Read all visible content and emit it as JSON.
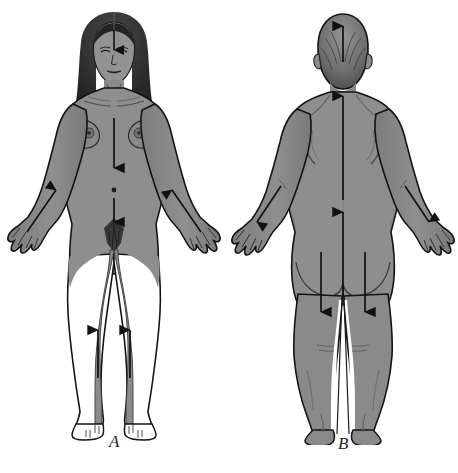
{
  "figure": {
    "title": "Anterior and posterior body views with directional flow arrows",
    "background_color": "#ffffff",
    "skin_fill": "#8c8c8c",
    "skin_fill_light": "#9a9a9a",
    "shadow_fill": "#6f6f6f",
    "hair_fill": "#2e2e2e",
    "outline_color": "#131313",
    "arrow_color": "#111111",
    "white_fill": "#ffffff"
  },
  "panels": [
    {
      "id": "anterior",
      "label": "A",
      "view": "anterior",
      "description": "Female figure, front view, arms abducted, showing downward arrows on forehead, chest and abdomen, upward arrows along forearms and lower legs",
      "arrows": [
        {
          "name": "forehead-arrow-down",
          "direction": "down",
          "region": "forehead"
        },
        {
          "name": "chest-arrow-down",
          "direction": "down",
          "region": "sternum-to-epigastrium"
        },
        {
          "name": "abdomen-arrow-down",
          "direction": "down",
          "region": "umbilicus-to-pubis"
        },
        {
          "name": "left-forearm-arrow-up",
          "direction": "up-inward",
          "region": "right-forearm"
        },
        {
          "name": "right-forearm-arrow-up",
          "direction": "up-inward",
          "region": "left-forearm"
        },
        {
          "name": "left-shin-arrow-up",
          "direction": "up",
          "region": "right-shin"
        },
        {
          "name": "right-shin-arrow-up",
          "direction": "up",
          "region": "left-shin"
        }
      ],
      "landmarks": [
        "hair",
        "eyes",
        "nose",
        "mouth",
        "clavicles",
        "breasts",
        "nipples",
        "umbilicus",
        "pubic-hair",
        "hands",
        "feet"
      ]
    },
    {
      "id": "posterior",
      "label": "B",
      "view": "posterior",
      "description": "Figure, back view, arms abducted, showing upward arrows on head, neck, upper back and lower back, downward arrows along forearms and posterior thighs",
      "arrows": [
        {
          "name": "head-arrow-up",
          "direction": "up",
          "region": "occiput"
        },
        {
          "name": "upper-back-arrow-up",
          "direction": "up",
          "region": "thoracic-spine"
        },
        {
          "name": "lower-back-arrow-up",
          "direction": "up",
          "region": "lumbar-sacral-spine"
        },
        {
          "name": "left-forearm-arrow-down",
          "direction": "down-outward",
          "region": "right-forearm"
        },
        {
          "name": "right-forearm-arrow-down",
          "direction": "down-outward",
          "region": "left-forearm"
        },
        {
          "name": "left-thigh-arrow-down",
          "direction": "down",
          "region": "right-posterior-thigh"
        },
        {
          "name": "right-thigh-arrow-down",
          "direction": "down",
          "region": "left-posterior-thigh"
        }
      ],
      "landmarks": [
        "hair",
        "ears",
        "scapulae",
        "spine-groove",
        "gluteal-cleft",
        "popliteal-creases",
        "hands",
        "heels"
      ]
    }
  ]
}
